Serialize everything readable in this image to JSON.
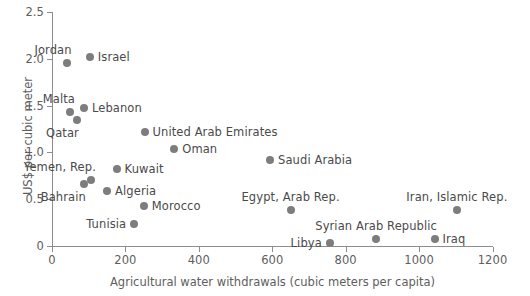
{
  "chart_data": {
    "type": "scatter",
    "title": "",
    "xlabel": "Agricultural water withdrawals (cubic meters per capita)",
    "ylabel": "US$ per cubic meter",
    "xlim": [
      0,
      1200
    ],
    "ylim": [
      0,
      2.5
    ],
    "xticks": [
      0,
      200,
      400,
      600,
      800,
      1000,
      1200
    ],
    "xtick_labels": [
      "0",
      "200",
      "400",
      "600",
      "800",
      "1000",
      "1200"
    ],
    "yticks": [
      0,
      0.5,
      1.0,
      1.5,
      2.0,
      2.5
    ],
    "ytick_labels": [
      "0",
      "0.5",
      "1.0",
      "1.5",
      "2.0",
      "2.5"
    ],
    "grid": false,
    "legend": "none",
    "marker_color": "#7d7d7d",
    "axis_color": "#8d8d8d",
    "text_color": "#4a4a4a",
    "points": [
      {
        "label": "Jordan",
        "x": 40,
        "y": 1.96,
        "label_pos": "above-left"
      },
      {
        "label": "Israel",
        "x": 103,
        "y": 2.02,
        "label_pos": "right"
      },
      {
        "label": "Malta",
        "x": 49,
        "y": 1.43,
        "label_pos": "above-left"
      },
      {
        "label": "Lebanon",
        "x": 87,
        "y": 1.47,
        "label_pos": "right"
      },
      {
        "label": "Qatar",
        "x": 68,
        "y": 1.35,
        "label_pos": "below-left"
      },
      {
        "label": "United Arab Emirates",
        "x": 252,
        "y": 1.22,
        "label_pos": "right"
      },
      {
        "label": "Oman",
        "x": 333,
        "y": 1.04,
        "label_pos": "right"
      },
      {
        "label": "Saudi Arabia",
        "x": 594,
        "y": 0.92,
        "label_pos": "right"
      },
      {
        "label": "Kuwait",
        "x": 176,
        "y": 0.82,
        "label_pos": "right"
      },
      {
        "label": "Yemen, Rep.",
        "x": 106,
        "y": 0.7,
        "label_pos": "above-left"
      },
      {
        "label": "Bahrain",
        "x": 87,
        "y": 0.66,
        "label_pos": "below-left"
      },
      {
        "label": "Algeria",
        "x": 150,
        "y": 0.59,
        "label_pos": "right"
      },
      {
        "label": "Morocco",
        "x": 250,
        "y": 0.43,
        "label_pos": "right"
      },
      {
        "label": "Egypt, Arab Rep.",
        "x": 650,
        "y": 0.38,
        "label_pos": "above-center"
      },
      {
        "label": "Iran, Islamic Rep.",
        "x": 1103,
        "y": 0.38,
        "label_pos": "above-center"
      },
      {
        "label": "Tunisia",
        "x": 224,
        "y": 0.24,
        "label_pos": "left"
      },
      {
        "label": "Syrian Arab Republic",
        "x": 883,
        "y": 0.08,
        "label_pos": "above-center"
      },
      {
        "label": "Iraq",
        "x": 1042,
        "y": 0.07,
        "label_pos": "right"
      },
      {
        "label": "Libya",
        "x": 757,
        "y": 0.03,
        "label_pos": "left"
      }
    ]
  }
}
